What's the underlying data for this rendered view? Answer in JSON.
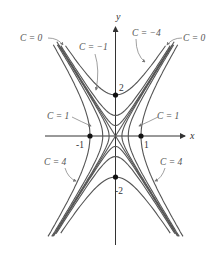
{
  "diagram": {
    "type": "level-curves",
    "function": "f(x,y) = 4x^2 - y^2",
    "axes": {
      "x_label": "x",
      "y_label": "y"
    },
    "ticks": {
      "x_neg": "-1",
      "x_pos": "1",
      "y_pos": "2",
      "y_neg": "-2"
    },
    "labels": {
      "c0_left": "C = 0",
      "c0_right": "C = 0",
      "cm1": "C = −1",
      "cm4": "C = −4",
      "c1_left": "C = 1",
      "c1_right": "C = 1",
      "c4_left": "C = 4",
      "c4_right": "C = 4"
    },
    "levels": [
      -4,
      -1,
      0,
      1,
      4
    ],
    "curve_color": "#555555",
    "axis_color": "#333333"
  }
}
